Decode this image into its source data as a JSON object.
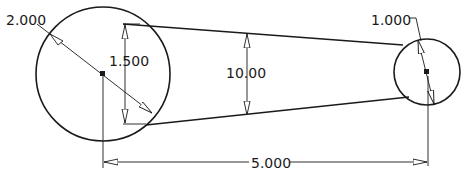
{
  "drawing": {
    "colors": {
      "stroke": "#1a1a1a",
      "background": "#ffffff",
      "arrow_fill": "#ffffff"
    },
    "big_circle": {
      "diameter_label": "2.000"
    },
    "small_circle": {
      "diameter_label": "1.000"
    },
    "dimensions": {
      "big_vertical": "1.500",
      "middle_vertical": "10.00",
      "center_distance": "5.000"
    }
  }
}
